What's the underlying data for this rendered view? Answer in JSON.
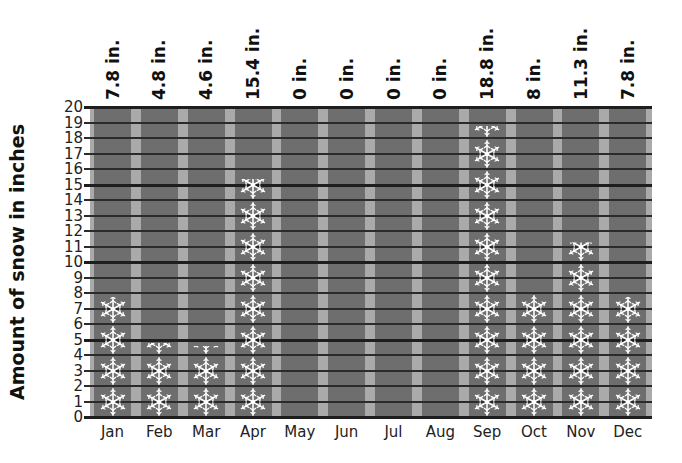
{
  "chart_data": {
    "type": "bar",
    "subtype": "pictograph",
    "title": "",
    "xlabel": "",
    "ylabel": "Amount of snow in inches",
    "ylim": [
      0,
      20
    ],
    "yticks": [
      "0",
      "1",
      "2",
      "3",
      "4",
      "5",
      "6",
      "7",
      "8",
      "9",
      "10",
      "11",
      "12",
      "13",
      "14",
      "15",
      "16",
      "17",
      "18",
      "19",
      "20"
    ],
    "categories": [
      "Jan",
      "Feb",
      "Mar",
      "Apr",
      "May",
      "Jun",
      "Jul",
      "Aug",
      "Sep",
      "Oct",
      "Nov",
      "Dec"
    ],
    "values": [
      7.8,
      4.8,
      4.6,
      15.4,
      0,
      0,
      0,
      0,
      18.8,
      8,
      11.3,
      7.8
    ],
    "value_labels": [
      "7.8 in.",
      "4.8 in.",
      "4.6 in.",
      "15.4 in.",
      "0 in.",
      "0 in.",
      "0 in.",
      "0 in.",
      "18.8 in.",
      "8 in.",
      "11.3 in.",
      "7.8 in."
    ],
    "icon": "snowflake-icon",
    "icon_unit_inches": 2,
    "grid": true,
    "colors": {
      "column": "#6e6e6e",
      "gap": "#aaaaaa",
      "gridline": "#2b2b2b",
      "icon": "#ffffff"
    }
  }
}
